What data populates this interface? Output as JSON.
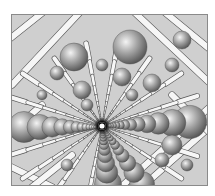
{
  "image": {
    "description": "Grayscale ball-and-stick rendering of a crystal lattice viewed down a channel toward a central vanishing point",
    "subject": "crystal-lattice-channel",
    "colors": {
      "background": "#ffffff",
      "frame_fill": "#cfcfcf",
      "frame_border": "#8a8a8a",
      "stick_fill": "#f6f6f6",
      "stick_edge": "#5a5a5a",
      "atom_light": "#f2f2f2",
      "atom_mid": "#a9a9a9",
      "atom_dark": "#555555",
      "center_glow": "#ffffff",
      "center_dark": "#0a0a0a"
    },
    "vanishing_point": {
      "x": 90,
      "y": 111
    }
  }
}
